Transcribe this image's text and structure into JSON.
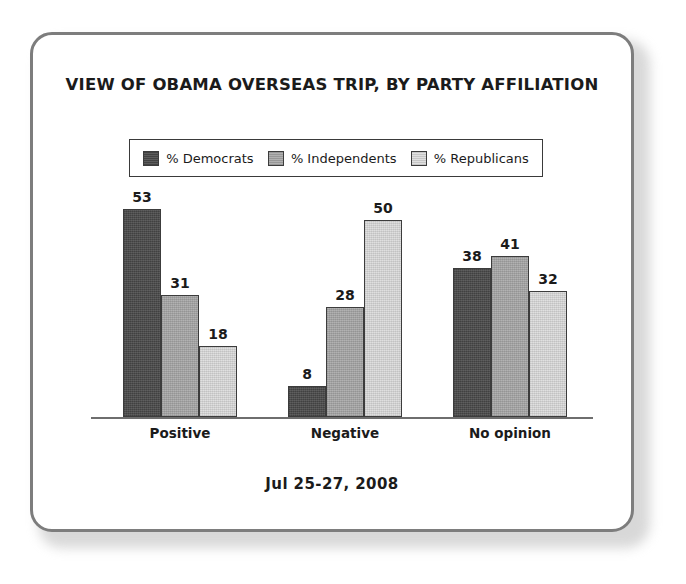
{
  "card": {
    "title": "VIEW OF OBAMA OVERSEAS TRIP, BY PARTY AFFILIATION",
    "footer_date": "Jul 25-27, 2008"
  },
  "legend": {
    "items": [
      {
        "label": "% Democrats",
        "color": "#4a4a4a"
      },
      {
        "label": "% Independents",
        "color": "#a8a8a8"
      },
      {
        "label": "% Republicans",
        "color": "#dcdcdc"
      }
    ]
  },
  "chart_data": {
    "type": "bar",
    "title": "VIEW OF OBAMA OVERSEAS TRIP, BY PARTY AFFILIATION",
    "subtitle": "Jul 25-27, 2008",
    "xlabel": "",
    "ylabel": "",
    "ylim": [
      0,
      60
    ],
    "grid": false,
    "legend_position": "top",
    "categories": [
      "Positive",
      "Negative",
      "No opinion"
    ],
    "series": [
      {
        "name": "% Democrats",
        "color": "#4a4a4a",
        "values": [
          53,
          8,
          38
        ]
      },
      {
        "name": "% Independents",
        "color": "#a8a8a8",
        "values": [
          31,
          28,
          41
        ]
      },
      {
        "name": "% Republicans",
        "color": "#dcdcdc",
        "values": [
          18,
          50,
          32
        ]
      }
    ]
  }
}
